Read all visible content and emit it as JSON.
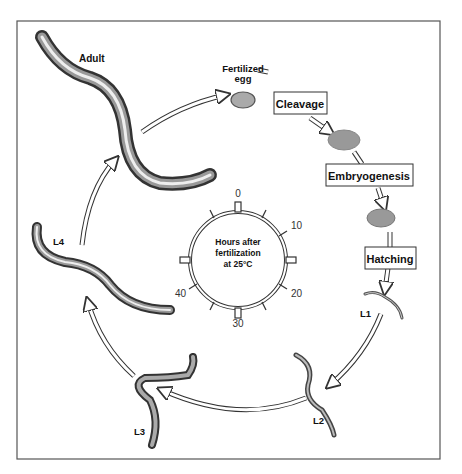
{
  "diagram": {
    "stages": {
      "adult": "Adult",
      "egg_line1": "Fertilized",
      "egg_line2": "egg",
      "l1": "L1",
      "l2": "L2",
      "l3": "L3",
      "l4": "L4"
    },
    "processes": {
      "cleavage": "Cleavage",
      "embryogenesis": "Embryogenesis",
      "hatching": "Hatching"
    },
    "clock": {
      "caption_line1": "Hours after",
      "caption_line2": "fertilization",
      "caption_line3": "at 25°C",
      "ticks": [
        "0",
        "10",
        "20",
        "30",
        "40"
      ]
    },
    "colors": {
      "frame": "#555555",
      "worm_dark": "#3a3a3a",
      "worm_light": "#e8e8e8",
      "egg": "#a8a8a8"
    }
  }
}
